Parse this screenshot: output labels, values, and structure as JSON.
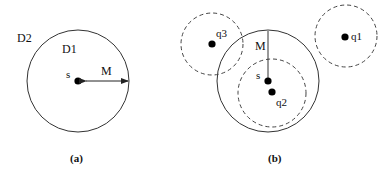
{
  "panels": [
    {
      "caption": "(a)",
      "labels": {
        "outer_region": "D2",
        "inner_region": "D1",
        "center": "s",
        "radius": "M"
      }
    },
    {
      "caption": "(b)",
      "labels": {
        "center": "s",
        "radius": "M",
        "q1": "q1",
        "q2": "q2",
        "q3": "q3"
      }
    }
  ],
  "colors": {
    "stroke": "#222222",
    "dashed": "#444444",
    "dot": "#000000",
    "background": "#ffffff"
  }
}
